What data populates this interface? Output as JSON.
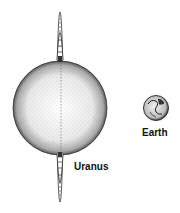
{
  "diagram": {
    "planets": [
      {
        "name": "Uranus",
        "label": "Uranus",
        "has_ring": true
      },
      {
        "name": "Earth",
        "label": "Earth",
        "has_ring": false
      }
    ]
  },
  "labels": {
    "uranus": "Uranus",
    "earth": "Earth"
  }
}
